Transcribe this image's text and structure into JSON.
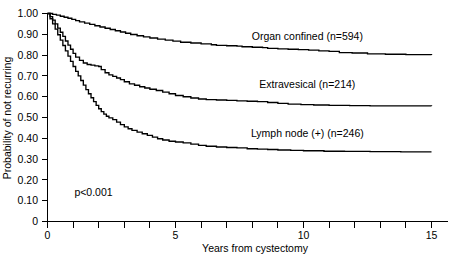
{
  "chart_data": {
    "type": "line",
    "title": "",
    "subtitle": "",
    "xlabel": "Years from cystectomy",
    "ylabel": "Probability of not recurring",
    "xlim": [
      0,
      15.5
    ],
    "ylim": [
      0,
      1.0
    ],
    "grid": false,
    "legend_position": "inline-right",
    "x_ticks": [
      0,
      1,
      2,
      3,
      4,
      5,
      6,
      7,
      8,
      9,
      10,
      11,
      12,
      13,
      14,
      15
    ],
    "x_tick_labels": [
      "0",
      "",
      "",
      "",
      "",
      "5",
      "",
      "",
      "",
      "",
      "10",
      "",
      "",
      "",
      "",
      "15"
    ],
    "y_ticks": [
      0,
      0.1,
      0.2,
      0.3,
      0.4,
      0.5,
      0.6,
      0.7,
      0.8,
      0.9,
      1.0
    ],
    "y_tick_labels": [
      "0",
      "0.10",
      "0.20",
      "0.30",
      "0.40",
      "0.50",
      "0.60",
      "0.70",
      "0.80",
      "0.90",
      "1.00"
    ],
    "annotations": [
      {
        "id": "pvalue",
        "text": "p<0.001",
        "x": 1.05,
        "y": 0.125
      }
    ],
    "series": [
      {
        "name": "Organ confined (n=594)",
        "label": "Organ confined (n=594)",
        "color": "#000000",
        "n": 594,
        "label_x": 10.15,
        "label_y": 0.875,
        "final_value": 0.8,
        "points": [
          [
            0.0,
            1.0
          ],
          [
            0.2,
            0.996
          ],
          [
            0.35,
            0.992
          ],
          [
            0.5,
            0.987
          ],
          [
            0.65,
            0.982
          ],
          [
            0.8,
            0.977
          ],
          [
            0.95,
            0.972
          ],
          [
            1.1,
            0.966
          ],
          [
            1.25,
            0.96
          ],
          [
            1.45,
            0.954
          ],
          [
            1.65,
            0.948
          ],
          [
            1.85,
            0.941
          ],
          [
            2.05,
            0.935
          ],
          [
            2.25,
            0.929
          ],
          [
            2.45,
            0.923
          ],
          [
            2.65,
            0.917
          ],
          [
            2.85,
            0.911
          ],
          [
            3.05,
            0.905
          ],
          [
            3.25,
            0.899
          ],
          [
            3.5,
            0.893
          ],
          [
            3.75,
            0.888
          ],
          [
            4.0,
            0.882
          ],
          [
            4.3,
            0.877
          ],
          [
            4.6,
            0.872
          ],
          [
            4.9,
            0.867
          ],
          [
            5.2,
            0.862
          ],
          [
            5.6,
            0.858
          ],
          [
            6.0,
            0.854
          ],
          [
            6.4,
            0.85
          ],
          [
            6.6,
            0.847
          ],
          [
            7.0,
            0.845
          ],
          [
            7.4,
            0.843
          ],
          [
            7.6,
            0.84
          ],
          [
            8.0,
            0.838
          ],
          [
            8.4,
            0.836
          ],
          [
            8.6,
            0.832
          ],
          [
            9.0,
            0.83
          ],
          [
            9.4,
            0.828
          ],
          [
            9.8,
            0.826
          ],
          [
            10.2,
            0.824
          ],
          [
            10.6,
            0.82
          ],
          [
            11.0,
            0.818
          ],
          [
            11.4,
            0.812
          ],
          [
            11.9,
            0.81
          ],
          [
            12.5,
            0.806
          ],
          [
            13.2,
            0.804
          ],
          [
            14.0,
            0.802
          ],
          [
            15.0,
            0.8
          ]
        ]
      },
      {
        "name": "Extravesical (n=214)",
        "label": "Extravesical (n=214)",
        "color": "#000000",
        "n": 214,
        "label_x": 10.15,
        "label_y": 0.64,
        "final_value": 0.555,
        "points": [
          [
            0.0,
            1.0
          ],
          [
            0.1,
            0.985
          ],
          [
            0.2,
            0.968
          ],
          [
            0.3,
            0.95
          ],
          [
            0.4,
            0.93
          ],
          [
            0.5,
            0.91
          ],
          [
            0.6,
            0.89
          ],
          [
            0.7,
            0.868
          ],
          [
            0.8,
            0.848
          ],
          [
            0.9,
            0.828
          ],
          [
            1.0,
            0.808
          ],
          [
            1.1,
            0.79
          ],
          [
            1.25,
            0.775
          ],
          [
            1.4,
            0.762
          ],
          [
            1.55,
            0.755
          ],
          [
            1.7,
            0.752
          ],
          [
            1.85,
            0.748
          ],
          [
            2.0,
            0.745
          ],
          [
            2.1,
            0.73
          ],
          [
            2.25,
            0.715
          ],
          [
            2.4,
            0.705
          ],
          [
            2.55,
            0.698
          ],
          [
            2.7,
            0.69
          ],
          [
            2.85,
            0.682
          ],
          [
            3.0,
            0.672
          ],
          [
            3.2,
            0.662
          ],
          [
            3.4,
            0.655
          ],
          [
            3.6,
            0.648
          ],
          [
            3.8,
            0.642
          ],
          [
            4.0,
            0.636
          ],
          [
            4.25,
            0.63
          ],
          [
            4.5,
            0.622
          ],
          [
            4.75,
            0.614
          ],
          [
            5.0,
            0.606
          ],
          [
            5.3,
            0.6
          ],
          [
            5.6,
            0.594
          ],
          [
            5.9,
            0.589
          ],
          [
            6.2,
            0.586
          ],
          [
            6.6,
            0.584
          ],
          [
            7.0,
            0.582
          ],
          [
            7.4,
            0.58
          ],
          [
            7.8,
            0.578
          ],
          [
            8.2,
            0.576
          ],
          [
            8.6,
            0.572
          ],
          [
            9.0,
            0.568
          ],
          [
            9.4,
            0.564
          ],
          [
            9.9,
            0.562
          ],
          [
            10.4,
            0.56
          ],
          [
            11.0,
            0.558
          ],
          [
            11.8,
            0.557
          ],
          [
            12.6,
            0.556
          ],
          [
            13.5,
            0.556
          ],
          [
            15.0,
            0.555
          ]
        ]
      },
      {
        "name": "Lymph node (+) (n=246)",
        "label": "Lymph node (+) (n=246)",
        "color": "#000000",
        "n": 246,
        "label_x": 10.15,
        "label_y": 0.405,
        "final_value": 0.335,
        "points": [
          [
            0.0,
            1.0
          ],
          [
            0.1,
            0.975
          ],
          [
            0.2,
            0.95
          ],
          [
            0.3,
            0.925
          ],
          [
            0.4,
            0.898
          ],
          [
            0.5,
            0.872
          ],
          [
            0.6,
            0.846
          ],
          [
            0.7,
            0.82
          ],
          [
            0.8,
            0.795
          ],
          [
            0.9,
            0.77
          ],
          [
            1.0,
            0.745
          ],
          [
            1.1,
            0.722
          ],
          [
            1.2,
            0.7
          ],
          [
            1.3,
            0.678
          ],
          [
            1.4,
            0.656
          ],
          [
            1.5,
            0.634
          ],
          [
            1.6,
            0.614
          ],
          [
            1.7,
            0.595
          ],
          [
            1.8,
            0.576
          ],
          [
            1.9,
            0.558
          ],
          [
            2.0,
            0.542
          ],
          [
            2.1,
            0.528
          ],
          [
            2.2,
            0.516
          ],
          [
            2.3,
            0.506
          ],
          [
            2.4,
            0.498
          ],
          [
            2.55,
            0.49
          ],
          [
            2.7,
            0.478
          ],
          [
            2.85,
            0.466
          ],
          [
            3.0,
            0.455
          ],
          [
            3.15,
            0.446
          ],
          [
            3.3,
            0.438
          ],
          [
            3.5,
            0.43
          ],
          [
            3.7,
            0.422
          ],
          [
            3.9,
            0.414
          ],
          [
            4.1,
            0.406
          ],
          [
            4.3,
            0.398
          ],
          [
            4.5,
            0.392
          ],
          [
            4.75,
            0.386
          ],
          [
            5.0,
            0.382
          ],
          [
            5.3,
            0.378
          ],
          [
            5.6,
            0.372
          ],
          [
            5.9,
            0.366
          ],
          [
            6.2,
            0.362
          ],
          [
            6.6,
            0.358
          ],
          [
            7.0,
            0.356
          ],
          [
            7.4,
            0.354
          ],
          [
            7.8,
            0.35
          ],
          [
            8.2,
            0.348
          ],
          [
            8.6,
            0.346
          ],
          [
            9.0,
            0.344
          ],
          [
            9.5,
            0.342
          ],
          [
            10.0,
            0.34
          ],
          [
            10.8,
            0.338
          ],
          [
            11.6,
            0.337
          ],
          [
            12.6,
            0.336
          ],
          [
            13.8,
            0.335
          ],
          [
            15.0,
            0.335
          ]
        ]
      }
    ]
  },
  "figure": {
    "pvalue_text": "p<0.001",
    "ylabel_text": "Probability of not recurring",
    "xlabel_text": "Years from cystectomy"
  }
}
